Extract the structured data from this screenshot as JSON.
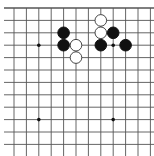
{
  "board": {
    "description": "Go problem diagram, top-left section of a 19x19 board",
    "visible_columns": 12,
    "visible_rows": 12,
    "top_edge": true,
    "origin_x": 14,
    "origin_y": 8,
    "spacing": 12.4,
    "line_color": "#555555",
    "hoshi": [
      {
        "col": 2,
        "row": 3
      },
      {
        "col": 8,
        "row": 3
      },
      {
        "col": 2,
        "row": 9
      },
      {
        "col": 8,
        "row": 9
      }
    ],
    "stones": [
      {
        "color": "black",
        "col": 4,
        "row": 2
      },
      {
        "color": "black",
        "col": 4,
        "row": 3
      },
      {
        "color": "white",
        "col": 5,
        "row": 3
      },
      {
        "color": "white",
        "col": 5,
        "row": 4
      },
      {
        "color": "white",
        "col": 7,
        "row": 1
      },
      {
        "color": "white",
        "col": 7,
        "row": 2
      },
      {
        "color": "black",
        "col": 8,
        "row": 2
      },
      {
        "color": "black",
        "col": 7,
        "row": 3
      },
      {
        "color": "black",
        "col": 9,
        "row": 3
      }
    ]
  }
}
